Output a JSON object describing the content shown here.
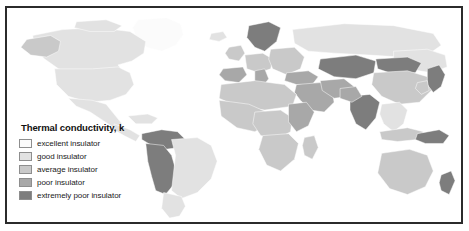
{
  "figure": {
    "background_color": "#ffffff",
    "border_color": "#2b2b2b",
    "ocean_color": "#ffffff"
  },
  "legend": {
    "title": "Thermal conductivity, k",
    "items": [
      {
        "label": "excellent insulator",
        "color": "#fbfbfb"
      },
      {
        "label": "good insulator",
        "color": "#e2e2e2"
      },
      {
        "label": "average insulator",
        "color": "#c9c9c9"
      },
      {
        "label": "poor insulator",
        "color": "#a8a8a8"
      },
      {
        "label": "extremely poor insulator",
        "color": "#7d7d7d"
      }
    ]
  },
  "map": {
    "type": "choropleth",
    "projection": "world",
    "regions": [
      {
        "name": "Greenland",
        "class_index": 0
      },
      {
        "name": "Canada",
        "class_index": 1
      },
      {
        "name": "Alaska",
        "class_index": 2
      },
      {
        "name": "United States",
        "class_index": 1
      },
      {
        "name": "Mexico",
        "class_index": 1
      },
      {
        "name": "Central America",
        "class_index": 1
      },
      {
        "name": "Caribbean",
        "class_index": 1
      },
      {
        "name": "Colombia",
        "class_index": 4
      },
      {
        "name": "Venezuela",
        "class_index": 4
      },
      {
        "name": "Ecuador",
        "class_index": 4
      },
      {
        "name": "Peru",
        "class_index": 4
      },
      {
        "name": "Bolivia",
        "class_index": 4
      },
      {
        "name": "Brazil",
        "class_index": 1
      },
      {
        "name": "Chile",
        "class_index": 1
      },
      {
        "name": "Argentina",
        "class_index": 1
      },
      {
        "name": "Iceland",
        "class_index": 1
      },
      {
        "name": "Scandinavia",
        "class_index": 4
      },
      {
        "name": "United Kingdom",
        "class_index": 2
      },
      {
        "name": "Western Europe",
        "class_index": 2
      },
      {
        "name": "Spain and Portugal",
        "class_index": 3
      },
      {
        "name": "Italy",
        "class_index": 3
      },
      {
        "name": "Eastern Europe",
        "class_index": 2
      },
      {
        "name": "Russia",
        "class_index": 1
      },
      {
        "name": "Turkey",
        "class_index": 3
      },
      {
        "name": "Middle East",
        "class_index": 3
      },
      {
        "name": "Saudi Arabia",
        "class_index": 3
      },
      {
        "name": "Iran",
        "class_index": 3
      },
      {
        "name": "Kazakhstan",
        "class_index": 4
      },
      {
        "name": "Central Asia",
        "class_index": 4
      },
      {
        "name": "Mongolia",
        "class_index": 4
      },
      {
        "name": "China",
        "class_index": 2
      },
      {
        "name": "India",
        "class_index": 4
      },
      {
        "name": "Pakistan",
        "class_index": 3
      },
      {
        "name": "Southeast Asia",
        "class_index": 1
      },
      {
        "name": "Japan",
        "class_index": 4
      },
      {
        "name": "North Africa",
        "class_index": 2
      },
      {
        "name": "West Africa",
        "class_index": 2
      },
      {
        "name": "Central Africa",
        "class_index": 2
      },
      {
        "name": "East Africa",
        "class_index": 3
      },
      {
        "name": "Southern Africa",
        "class_index": 2
      },
      {
        "name": "Madagascar",
        "class_index": 2
      },
      {
        "name": "Indonesia",
        "class_index": 2
      },
      {
        "name": "Papua New Guinea",
        "class_index": 4
      },
      {
        "name": "Australia",
        "class_index": 2
      },
      {
        "name": "New Zealand",
        "class_index": 4
      }
    ]
  }
}
